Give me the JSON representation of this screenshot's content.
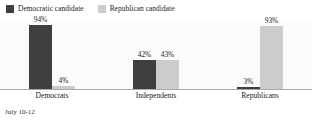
{
  "legend": {
    "items": [
      {
        "label": "Democratic candidate",
        "color": "#3f3f3f",
        "key": "democratic"
      },
      {
        "label": "Republican candidate",
        "color": "#cccccc",
        "key": "republican"
      }
    ]
  },
  "footnote": "July 10-12",
  "chart_data": {
    "type": "bar",
    "title": "",
    "subtitle": "",
    "xlabel": "",
    "ylabel": "",
    "ylim": [
      0,
      100
    ],
    "grid": false,
    "legend_position": "top-left",
    "value_suffix": "%",
    "categories": [
      "Democrats",
      "Independents",
      "Republicans"
    ],
    "series": [
      {
        "name": "Democratic candidate",
        "color": "#3f3f3f",
        "values": [
          94,
          42,
          3
        ],
        "labels": [
          "94%",
          "42%",
          "3%"
        ]
      },
      {
        "name": "Republican candidate",
        "color": "#cccccc",
        "values": [
          4,
          43,
          93
        ],
        "labels": [
          "4%",
          "43%",
          "93%"
        ]
      }
    ],
    "annotations": [
      "July 10-12"
    ]
  }
}
